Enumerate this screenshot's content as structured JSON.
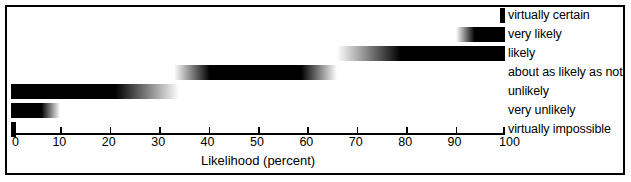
{
  "figure": {
    "axis_title": "Likelihood (percent)",
    "frame_color": "#000000",
    "background_color": "#ffffff",
    "bar_color": "#000000"
  },
  "chart_data": {
    "type": "bar",
    "title": "",
    "xlabel": "Likelihood (percent)",
    "ylabel": "",
    "xlim": [
      0,
      100
    ],
    "xticks": [
      0,
      10,
      20,
      30,
      40,
      50,
      60,
      70,
      80,
      90,
      100
    ],
    "xticklabels": [
      "0",
      "10",
      "20",
      "30",
      "40",
      "50",
      "60",
      "70",
      "80",
      "90",
      "100"
    ],
    "grid": false,
    "legend": "right-inline-labels",
    "orientation": "horizontal",
    "note": "Each row is a likelihood term drawn as a horizontal black bar spanning its probability range; bars fade to white at their open ends.",
    "categories": [
      "virtually certain",
      "very likely",
      "likely",
      "about as likely as not",
      "unlikely",
      "very unlikely",
      "virtually impossible"
    ],
    "bars": [
      {
        "label": "virtually certain",
        "start": 99,
        "end": 100,
        "fade": "none",
        "row": 0
      },
      {
        "label": "very likely",
        "start": 90,
        "end": 100,
        "fade": "left",
        "row": 1
      },
      {
        "label": "likely",
        "start": 66,
        "end": 100,
        "fade": "left",
        "row": 2
      },
      {
        "label": "about as likely as not",
        "start": 33,
        "end": 66,
        "fade": "both",
        "row": 3
      },
      {
        "label": "unlikely",
        "start": 0,
        "end": 34,
        "fade": "right",
        "row": 4
      },
      {
        "label": "very unlikely",
        "start": 0,
        "end": 10,
        "fade": "right",
        "row": 5
      },
      {
        "label": "virtually impossible",
        "start": 0,
        "end": 1,
        "fade": "none",
        "row": 6
      }
    ]
  }
}
